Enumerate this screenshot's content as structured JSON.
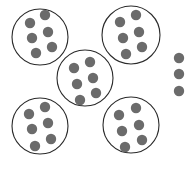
{
  "colors": {
    "background": "#ffffff",
    "circle_stroke": "#2a2a2a",
    "dot_fill": "#6b6b6b"
  },
  "groups": [
    {
      "id": "group-top-left",
      "cx": 40,
      "cy": 37,
      "r": 28,
      "dots": [
        [
          30,
          23
        ],
        [
          45,
          15
        ],
        [
          32,
          38
        ],
        [
          48,
          32
        ],
        [
          36,
          53
        ],
        [
          52,
          47
        ]
      ]
    },
    {
      "id": "group-top-right",
      "cx": 131,
      "cy": 35,
      "r": 29,
      "dots": [
        [
          120,
          22
        ],
        [
          136,
          15
        ],
        [
          123,
          38
        ],
        [
          139,
          32
        ],
        [
          126,
          54
        ],
        [
          142,
          47
        ]
      ]
    },
    {
      "id": "group-center",
      "cx": 85,
      "cy": 78,
      "r": 28,
      "dots": [
        [
          74,
          68
        ],
        [
          90,
          62
        ],
        [
          77,
          84
        ],
        [
          93,
          78
        ],
        [
          80,
          100
        ],
        [
          96,
          93
        ]
      ]
    },
    {
      "id": "group-bottom-left",
      "cx": 40,
      "cy": 126,
      "r": 28,
      "dots": [
        [
          29,
          114
        ],
        [
          45,
          107
        ],
        [
          32,
          129
        ],
        [
          48,
          123
        ],
        [
          35,
          146
        ],
        [
          51,
          139
        ]
      ]
    },
    {
      "id": "group-bottom-right",
      "cx": 131,
      "cy": 125,
      "r": 28,
      "dots": [
        [
          119,
          115
        ],
        [
          136,
          108
        ],
        [
          122,
          131
        ],
        [
          139,
          125
        ],
        [
          125,
          147
        ],
        [
          142,
          140
        ]
      ]
    }
  ],
  "dot_radius": 5.2,
  "loose_dots": [
    [
      179,
      58
    ],
    [
      179,
      74
    ],
    [
      179,
      91
    ]
  ],
  "summary": {
    "group_count": 5,
    "dots_per_group": 6,
    "loose_dot_count": 3
  }
}
